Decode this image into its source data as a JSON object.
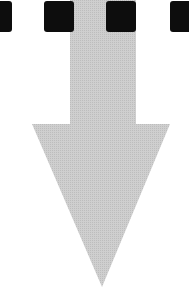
{
  "figure": {
    "colors": {
      "square": "#0d0d0d",
      "arrow": "#c8c8c8",
      "background": "#ffffff"
    },
    "squares": [
      {
        "x": -4,
        "width": 16
      },
      {
        "x": 44,
        "width": 30
      },
      {
        "x": 106,
        "width": 30
      },
      {
        "x": 170,
        "width": 24
      }
    ],
    "arrow": {
      "shaft": {
        "x": 70,
        "y": 0,
        "width": 66,
        "height": 126
      },
      "head": {
        "points": "32,124 170,124 102,287"
      }
    }
  }
}
